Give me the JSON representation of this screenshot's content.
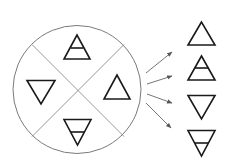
{
  "header": {
    "cropped_caption": ""
  },
  "diagram": {
    "type": "symbol-puzzle",
    "colors": {
      "stroke": "#1a1a1a",
      "circle_stroke": "#777777",
      "divider_stroke": "#888888",
      "arrow_stroke": "#666666",
      "background": "#ffffff"
    },
    "circle": {
      "label": "circle-divided-into-four-quadrants",
      "quadrants": [
        {
          "position": "top",
          "symbol": "triangle-up-with-bar"
        },
        {
          "position": "left",
          "symbol": "triangle-down"
        },
        {
          "position": "right",
          "symbol": "triangle-up"
        },
        {
          "position": "bottom",
          "symbol": "triangle-down-with-bar"
        }
      ]
    },
    "arrows": {
      "count": 4,
      "direction": "radiating-right"
    },
    "options": [
      {
        "index": 1,
        "symbol": "triangle-up"
      },
      {
        "index": 2,
        "symbol": "triangle-up-with-bar"
      },
      {
        "index": 3,
        "symbol": "triangle-down"
      },
      {
        "index": 4,
        "symbol": "triangle-down-with-bar"
      }
    ]
  }
}
